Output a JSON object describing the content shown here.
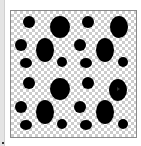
{
  "panel": {
    "type": "pattern-preview",
    "colors": {
      "blob": "#000000",
      "checker_light": "#ffffff",
      "checker_dark": "#cccccc",
      "frame_border": "#8a8a8a"
    },
    "blobs": [
      {
        "x": 29,
        "y": 22,
        "rx": 6,
        "ry": 6
      },
      {
        "x": 60,
        "y": 27,
        "rx": 10,
        "ry": 11
      },
      {
        "x": 88,
        "y": 22,
        "rx": 6,
        "ry": 6
      },
      {
        "x": 119,
        "y": 27,
        "rx": 9,
        "ry": 11
      },
      {
        "x": 21,
        "y": 45,
        "rx": 6,
        "ry": 6
      },
      {
        "x": 45,
        "y": 50,
        "rx": 9,
        "ry": 12
      },
      {
        "x": 80,
        "y": 45,
        "rx": 6,
        "ry": 6
      },
      {
        "x": 105,
        "y": 50,
        "rx": 9,
        "ry": 12
      },
      {
        "x": 26,
        "y": 63,
        "rx": 6,
        "ry": 5
      },
      {
        "x": 62,
        "y": 62,
        "rx": 5,
        "ry": 5
      },
      {
        "x": 86,
        "y": 63,
        "rx": 6,
        "ry": 5
      },
      {
        "x": 123,
        "y": 62,
        "rx": 5,
        "ry": 5
      },
      {
        "x": 29,
        "y": 83,
        "rx": 6,
        "ry": 6
      },
      {
        "x": 60,
        "y": 89,
        "rx": 10,
        "ry": 11
      },
      {
        "x": 88,
        "y": 83,
        "rx": 6,
        "ry": 6
      },
      {
        "x": 118,
        "y": 90,
        "rx": 9,
        "ry": 11
      },
      {
        "x": 21,
        "y": 107,
        "rx": 6,
        "ry": 6
      },
      {
        "x": 45,
        "y": 112,
        "rx": 9,
        "ry": 12
      },
      {
        "x": 80,
        "y": 107,
        "rx": 6,
        "ry": 6
      },
      {
        "x": 105,
        "y": 112,
        "rx": 9,
        "ry": 12
      },
      {
        "x": 26,
        "y": 125,
        "rx": 6,
        "ry": 5
      },
      {
        "x": 62,
        "y": 124,
        "rx": 5,
        "ry": 5
      },
      {
        "x": 86,
        "y": 125,
        "rx": 6,
        "ry": 5
      },
      {
        "x": 123,
        "y": 124,
        "rx": 5,
        "ry": 5
      }
    ],
    "cursor": {
      "x": 117,
      "y": 87
    }
  }
}
